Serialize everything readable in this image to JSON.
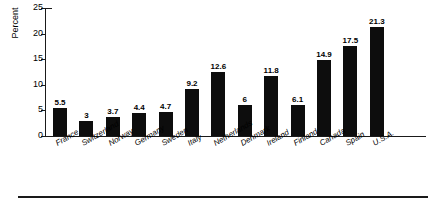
{
  "chart_data": {
    "type": "bar",
    "title": "",
    "xlabel": "",
    "ylabel": "Percent",
    "ylim": [
      0,
      25
    ],
    "yticks": [
      0,
      5,
      10,
      15,
      20,
      25
    ],
    "ytick_labels": [
      "0",
      "5",
      "10",
      "15",
      "20",
      "25"
    ],
    "grid": false,
    "legend": null,
    "bar_color": "#0d0d0d",
    "axis_color": "#1a1a1a",
    "value_labels_shown": true,
    "categories": [
      "France",
      "Switzerland",
      "Norway",
      "Germany",
      "Sweden",
      "Italy",
      "Netherlands",
      "Denmark",
      "Ireland",
      "Finland",
      "Canada",
      "Spain",
      "U.S.A."
    ],
    "values": [
      5.5,
      3,
      3.7,
      4.4,
      4.7,
      9.2,
      12.6,
      6,
      11.8,
      6.1,
      14.9,
      17.5,
      21.3
    ],
    "value_labels": [
      "5.5",
      "3",
      "3.7",
      "4.4",
      "4.7",
      "9.2",
      "12.6",
      "6",
      "11.8",
      "6.1",
      "14.9",
      "17.5",
      "21.3"
    ]
  }
}
